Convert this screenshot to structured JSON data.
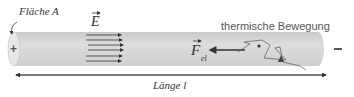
{
  "diagram": {
    "area_label": "Fläche A",
    "field_label": "E",
    "force_label": "F",
    "force_subscript": "el",
    "thermal_label": "thermische Bewegung",
    "length_label": "Länge l",
    "plus_sign": "+",
    "minus_sign": "−",
    "colors": {
      "conductor_fill": "#d6d6d6",
      "conductor_end": "#e6e6e6",
      "line": "#333333",
      "text": "#333333"
    },
    "field_arrows_count": 6
  }
}
